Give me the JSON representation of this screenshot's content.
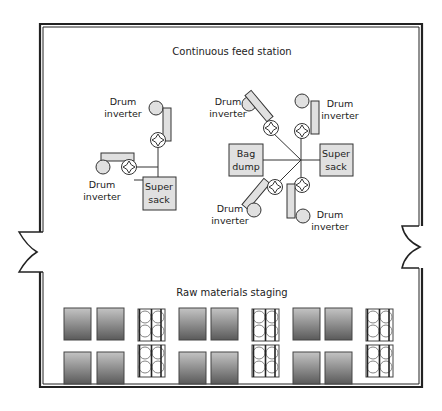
{
  "diagram": {
    "type": "facility-floor-plan",
    "sections": {
      "feed_station": {
        "title": "Continuous feed station"
      },
      "staging": {
        "title": "Raw materials staging"
      }
    },
    "labels": {
      "drum_inverter_1": "Drum",
      "drum_inverter_2": "inverter",
      "super_sack_1": "Super",
      "super_sack_2": "sack",
      "bag_dump_1": "Bag",
      "bag_dump_2": "dump"
    },
    "left_station": {
      "drum_inverters": 2,
      "super_sacks": 1
    },
    "right_station": {
      "drum_inverters": 4,
      "super_sacks": 1,
      "bag_dumps": 1
    },
    "staging_layout": {
      "rows": 2,
      "groups": 3,
      "per_group": [
        "tote",
        "tote",
        "drum-pallet"
      ]
    },
    "doors": [
      "left-wall-door",
      "right-wall-door"
    ],
    "colors": {
      "wall": "#222222",
      "equipment_fill": "#e0e0e0",
      "tote_gradient_top": "#b8b8b8",
      "tote_gradient_bottom": "#5c5c5c",
      "line": "#333333"
    }
  }
}
